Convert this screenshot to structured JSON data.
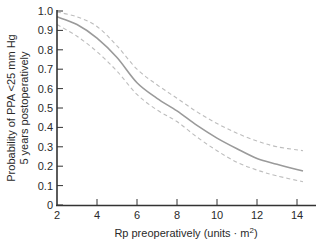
{
  "chart_data": {
    "type": "line",
    "title": "",
    "xlabel": "Rp preoperatively (units · m²)",
    "xlabel_parts": {
      "main": "Rp preoperatively (units · m",
      "sup": "2",
      "end": ")"
    },
    "ylabel": "Probability of PPA <25 mm Hg 5 years postoperatively",
    "ylabel_lines": [
      "Probability of PPA <25 mm Hg",
      "5 years postoperatively"
    ],
    "xlim": [
      2,
      15
    ],
    "ylim": [
      0,
      1.0
    ],
    "x_ticks": [
      2,
      4,
      6,
      8,
      10,
      12,
      14
    ],
    "x_tick_labels": [
      "2",
      "4",
      "6",
      "8",
      "10",
      "12",
      "14"
    ],
    "y_ticks": [
      0,
      0.1,
      0.2,
      0.3,
      0.4,
      0.5,
      0.6,
      0.7,
      0.8,
      0.9,
      1.0
    ],
    "y_tick_labels": [
      "0",
      "0.1",
      "0.2",
      "0.3",
      "0.4",
      "0.5",
      "0.6",
      "0.7",
      "0.8",
      "0.9",
      "1.0"
    ],
    "grid": false,
    "legend": null,
    "x": [
      2,
      3,
      4,
      5,
      6,
      7,
      8,
      9,
      10,
      11,
      12,
      13,
      14.3
    ],
    "series": [
      {
        "name": "Estimated probability",
        "style": "solid",
        "color": "#9a9a9a",
        "values": [
          0.97,
          0.93,
          0.86,
          0.76,
          0.63,
          0.55,
          0.485,
          0.41,
          0.345,
          0.29,
          0.24,
          0.21,
          0.175
        ]
      },
      {
        "name": "Upper confidence limit",
        "style": "dashed",
        "color": "#bdbdbd",
        "values": [
          0.995,
          0.97,
          0.92,
          0.82,
          0.7,
          0.62,
          0.55,
          0.48,
          0.42,
          0.37,
          0.33,
          0.3,
          0.28
        ]
      },
      {
        "name": "Lower confidence limit",
        "style": "dashed",
        "color": "#bdbdbd",
        "values": [
          0.93,
          0.87,
          0.79,
          0.69,
          0.57,
          0.49,
          0.43,
          0.35,
          0.28,
          0.22,
          0.18,
          0.15,
          0.12
        ]
      }
    ]
  }
}
